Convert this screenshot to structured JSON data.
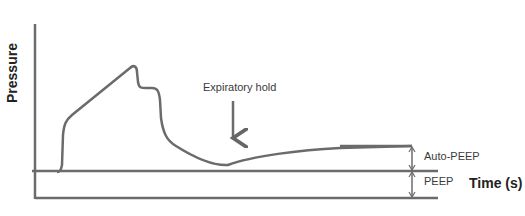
{
  "diagram": {
    "y_axis_label": "Pressure",
    "x_axis_label": "Time (s)",
    "annotation_hold": "Expiratory hold",
    "annotation_autopeep": "Auto-PEEP",
    "annotation_peep": "PEEP",
    "line_color": "#6b6b6b"
  }
}
